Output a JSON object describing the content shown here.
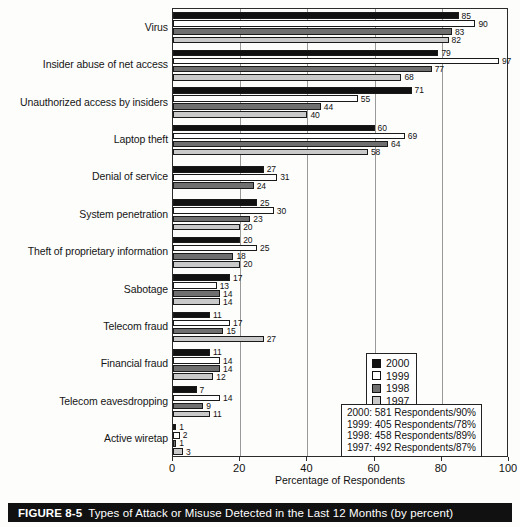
{
  "caption": {
    "figure_number": "FIGURE 8-5",
    "text": "Types of Attack or Misuse Detected in the Last 12 Months (by percent)"
  },
  "legend": {
    "items": [
      {
        "label": "2000",
        "color": "#111111"
      },
      {
        "label": "1999",
        "color": "#ffffff"
      },
      {
        "label": "1998",
        "color": "#6f6f6f"
      },
      {
        "label": "1997",
        "color": "#c9c9c9"
      }
    ]
  },
  "respondents_note": {
    "lines": [
      "2000:  581 Respondents/90%",
      "1999:  405 Respondents/78%",
      "1998:  458 Respondents/89%",
      "1997:  492 Respondents/87%"
    ]
  },
  "chart_data": {
    "type": "bar",
    "orientation": "horizontal",
    "title": "Types of Attack or Misuse Detected in the Last 12 Months (by percent)",
    "xlabel": "Percentage of Respondents",
    "ylabel": "",
    "xlim": [
      0,
      100
    ],
    "xticks": [
      0,
      20,
      40,
      60,
      80,
      100
    ],
    "grid": true,
    "legend_position": "right-lower",
    "categories": [
      "Virus",
      "Insider abuse of net access",
      "Unauthorized access by insiders",
      "Laptop theft",
      "Denial of service",
      "System penetration",
      "Theft of proprietary information",
      "Sabotage",
      "Telecom fraud",
      "Financial fraud",
      "Telecom eavesdropping",
      "Active wiretap"
    ],
    "series": [
      {
        "name": "2000",
        "color": "#111111",
        "values": [
          85,
          79,
          71,
          60,
          27,
          25,
          20,
          17,
          11,
          11,
          7,
          1
        ]
      },
      {
        "name": "1999",
        "color": "#ffffff",
        "values": [
          90,
          97,
          55,
          69,
          31,
          30,
          25,
          13,
          17,
          14,
          14,
          2
        ]
      },
      {
        "name": "1998",
        "color": "#6f6f6f",
        "values": [
          83,
          77,
          44,
          64,
          24,
          23,
          18,
          14,
          15,
          14,
          9,
          1
        ]
      },
      {
        "name": "1997",
        "color": "#c9c9c9",
        "values": [
          82,
          68,
          40,
          58,
          null,
          20,
          20,
          14,
          27,
          12,
          11,
          3
        ]
      }
    ]
  }
}
